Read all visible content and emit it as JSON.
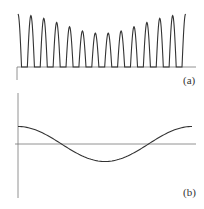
{
  "chart_data": [
    {
      "type": "line",
      "panel_label": "(a)",
      "title": "",
      "xlabel": "",
      "ylabel": "",
      "description": "Train of 14 half-wave pulses whose peak amplitude is modulated (high at edges, lowest in middle)",
      "x": [
        1,
        2,
        3,
        4,
        5,
        6,
        7,
        8,
        9,
        10,
        11,
        12,
        13,
        14
      ],
      "values": [
        1.0,
        0.97,
        0.92,
        0.84,
        0.76,
        0.68,
        0.64,
        0.64,
        0.68,
        0.76,
        0.84,
        0.92,
        0.97,
        1.0
      ],
      "ylim": [
        0,
        1.05
      ],
      "grid": false
    },
    {
      "type": "line",
      "panel_label": "(b)",
      "title": "",
      "xlabel": "",
      "ylabel": "",
      "description": "One period of a cosine envelope: starts positive, crosses zero, minimum at center, returns positive",
      "x": [
        0,
        0.25,
        0.5,
        0.75,
        1.0
      ],
      "values": [
        1.0,
        0.0,
        -1.0,
        0.0,
        1.0
      ],
      "ylim": [
        -1.5,
        1.5
      ],
      "grid": false
    }
  ],
  "labels": {
    "a": "(a)",
    "b": "(b)"
  }
}
